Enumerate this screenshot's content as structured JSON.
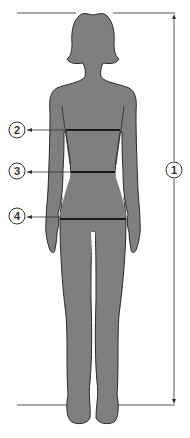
{
  "figure": {
    "colors": {
      "silhouette_fill": "#7f7f7f",
      "silhouette_outline": "#2a2a2a",
      "measure_line": "#1a1a1a",
      "guide_line": "#555555",
      "background": "#ffffff"
    },
    "markers": [
      {
        "id": "1",
        "label": "1",
        "type": "vertical-height",
        "meaning": "height"
      },
      {
        "id": "2",
        "label": "2",
        "type": "horizontal",
        "meaning": "bust"
      },
      {
        "id": "3",
        "label": "3",
        "type": "horizontal",
        "meaning": "waist"
      },
      {
        "id": "4",
        "label": "4",
        "type": "horizontal",
        "meaning": "hips"
      }
    ]
  }
}
